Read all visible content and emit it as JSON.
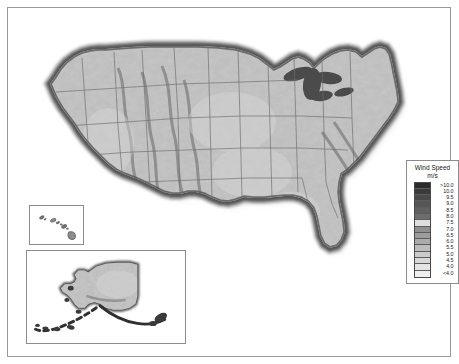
{
  "map": {
    "title": "United States Wind Resource Map",
    "projection": "albers-usa",
    "style": "grayscale-raster-shaded-relief",
    "insets": [
      {
        "name": "hawaii",
        "label": "Hawaii"
      },
      {
        "name": "alaska",
        "label": "Alaska"
      }
    ]
  },
  "legend": {
    "title": "Wind Speed",
    "units": "m/s",
    "entries": [
      {
        "label": ">10.0",
        "color": "#2b2b2b"
      },
      {
        "label": "10.0",
        "color": "#3a3a3a"
      },
      {
        "label": "9.5",
        "color": "#4a4a4a"
      },
      {
        "label": "9.0",
        "color": "#565656"
      },
      {
        "label": "8.5",
        "color": "#616161"
      },
      {
        "label": "8.0",
        "color": "#6d6d6d"
      },
      {
        "label": "7.5",
        "color": "#dedede"
      },
      {
        "label": "7.0",
        "color": "#8f8f8f"
      },
      {
        "label": "6.5",
        "color": "#9c9c9c"
      },
      {
        "label": "6.0",
        "color": "#ababab"
      },
      {
        "label": "5.5",
        "color": "#bcbcbc"
      },
      {
        "label": "5.0",
        "color": "#cbcbcb"
      },
      {
        "label": "4.5",
        "color": "#d8d8d8"
      },
      {
        "label": "4.0",
        "color": "#e4e4e4"
      },
      {
        "label": "<4.0",
        "color": "#efefef"
      }
    ]
  },
  "chart_data": {
    "type": "heatmap",
    "title": "Wind Speed",
    "ylabel": "m/s",
    "legend_position": "right",
    "categories": [
      ">10.0",
      "10.0",
      "9.5",
      "9.0",
      "8.5",
      "8.0",
      "7.5",
      "7.0",
      "6.5",
      "6.0",
      "5.5",
      "5.0",
      "4.5",
      "4.0",
      "<4.0"
    ],
    "values": [
      10.5,
      10.0,
      9.5,
      9.0,
      8.5,
      8.0,
      7.5,
      7.0,
      6.5,
      6.0,
      5.5,
      5.0,
      4.5,
      4.0,
      3.5
    ],
    "colors": [
      "#2b2b2b",
      "#3a3a3a",
      "#4a4a4a",
      "#565656",
      "#616161",
      "#6d6d6d",
      "#dedede",
      "#8f8f8f",
      "#9c9c9c",
      "#ababab",
      "#bcbcbc",
      "#cbcbcb",
      "#d8d8d8",
      "#e4e4e4",
      "#efefef"
    ]
  }
}
